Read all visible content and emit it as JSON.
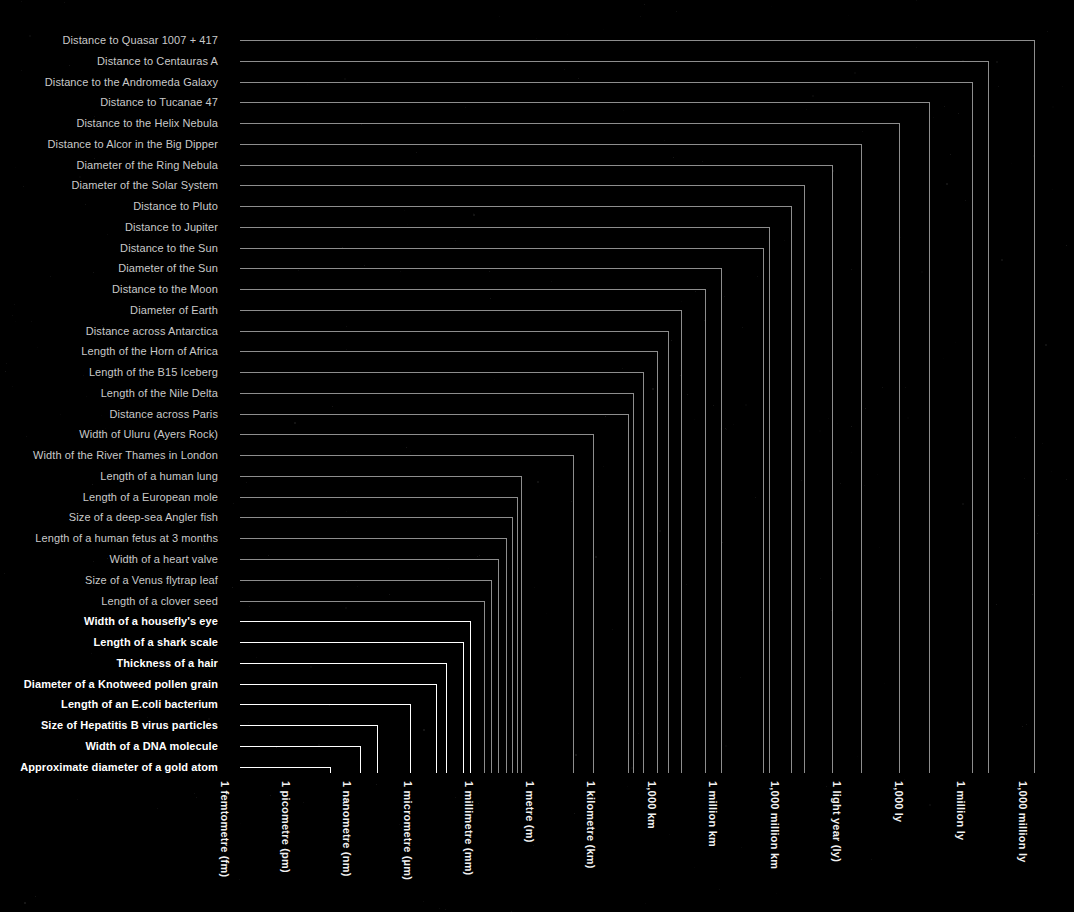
{
  "meta": {
    "background_color": "#000000",
    "dim_line_color": "#8d8d8d",
    "bright_line_color": "#ffffff",
    "dim_label_color": "#c9c9c9",
    "bright_label_color": "#ffffff"
  },
  "chart_data": {
    "type": "bar",
    "orientation": "horizontal-hook",
    "xlabel": "",
    "ylabel": "",
    "scale": "log",
    "grid": false,
    "legend": "none",
    "x_tick_labels": [
      "1 femtometre (fm)",
      "1 picometre (pm)",
      "1 nanometre (nm)",
      "1 micrometre (µm)",
      "1 millimetre (mm)",
      "1 metre (m)",
      "1 kilometre (km)",
      "1,000 km",
      "1 million km",
      "1,000 million km",
      "1 light year (ly)",
      "1,000 ly",
      "1 million ly",
      "1,000 million ly"
    ],
    "x_tick_px": [
      225,
      286,
      347,
      408,
      469,
      530,
      591,
      652,
      713,
      775,
      837,
      899,
      961,
      1023
    ],
    "x_tick_exponent_m": [
      -15,
      -12,
      -9,
      -6,
      -3,
      0,
      3,
      6,
      9,
      12,
      15.98,
      18.98,
      21.98,
      24.98
    ],
    "categories": [
      "Distance to Quasar 1007 + 417",
      "Distance to Centauras A",
      "Distance to the Andromeda Galaxy",
      "Distance to Tucanae 47",
      "Distance to the Helix Nebula",
      "Distance to Alcor in the Big Dipper",
      "Diameter of the Ring Nebula",
      "Diameter of the Solar System",
      "Distance to Pluto",
      "Distance to Jupiter",
      "Distance to the Sun",
      "Diameter of the Sun",
      "Distance to the Moon",
      "Diameter of Earth",
      "Distance across Antarctica",
      "Length of the Horn of Africa",
      "Length of the B15 Iceberg",
      "Length of the Nile Delta",
      "Distance across Paris",
      "Width of Uluru (Ayers Rock)",
      "Width of the River Thames in London",
      "Length of a human lung",
      "Length of a European mole",
      "Size of a deep-sea Angler fish",
      "Length of a human fetus at 3 months",
      "Width of a heart valve",
      "Size of a Venus flytrap leaf",
      "Length of a clover seed",
      "Width of a housefly's eye",
      "Length of a shark scale",
      "Thickness of a hair",
      "Diameter of a Knotweed pollen grain",
      "Length of an E.coli bacterium",
      "Size of Hepatitis B virus particles",
      "Width of a DNA molecule",
      "Approximate diameter of a gold atom"
    ],
    "value_px": [
      1034,
      988,
      972,
      929,
      899,
      861,
      832,
      804,
      791,
      769,
      763,
      721,
      705,
      681,
      668,
      657,
      643,
      633,
      628,
      593,
      573,
      521,
      517,
      512,
      506,
      498,
      491,
      484,
      470,
      463,
      446,
      436,
      410,
      377,
      360,
      330
    ],
    "values_label": [
      "1,000 million ly",
      "15 million ly",
      "2.5 million ly",
      "13,000 ly",
      "450 ly",
      "81 ly",
      "2 ly",
      "12,000 million km",
      "5,900 million km",
      "780 million km",
      "150 million km",
      "1.4 million km",
      "384,000 km",
      "12,700 km",
      "5,500 km",
      "3,000 km",
      "295 km",
      "160 km",
      "110 km",
      "3 km",
      "265 m",
      "27 cm",
      "20 cm",
      "16 cm",
      "11 cm",
      "6 cm",
      "4 cm",
      "2.5 cm",
      "1 mm",
      "0.5 mm",
      "80 µm",
      "40 µm",
      "2 µm",
      "42 nm",
      "2 nm",
      "0.3 nm"
    ],
    "highlight_from_index": 28
  },
  "geometry": {
    "label_right_px": 218,
    "lead_start_px": 240,
    "first_row_y": 40,
    "row_step": 20.76,
    "baseline_y": 773
  }
}
